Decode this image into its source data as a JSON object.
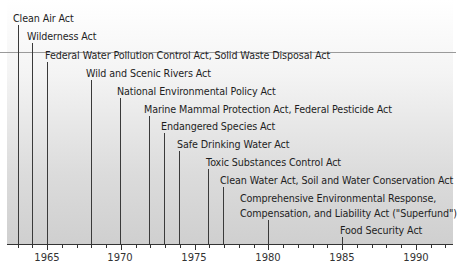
{
  "chart_data": {
    "type": "timeline",
    "title": "",
    "xlabel": "",
    "ylabel": "",
    "xlim": [
      1962,
      1992
    ],
    "tick_labels": [
      "1965",
      "1970",
      "1975",
      "1980",
      "1985",
      "1990"
    ],
    "events": [
      {
        "year": 1963,
        "label": "Clean Air Act"
      },
      {
        "year": 1964,
        "label": "Wilderness Act"
      },
      {
        "year": 1965,
        "label": "Federal Water Pollution Control Act, Solid Waste Disposal Act"
      },
      {
        "year": 1968,
        "label": "Wild and Scenic Rivers Act"
      },
      {
        "year": 1970,
        "label": "National Environmental Policy Act"
      },
      {
        "year": 1972,
        "label": "Marine Mammal Protection Act, Federal Pesticide Act"
      },
      {
        "year": 1973,
        "label": "Endangered Species Act"
      },
      {
        "year": 1974,
        "label": "Safe Drinking Water Act"
      },
      {
        "year": 1976,
        "label": "Toxic Substances Control Act"
      },
      {
        "year": 1977,
        "label": "Clean Water Act, Soil and Water Conservation Act"
      },
      {
        "year": 1980,
        "label": "Comprehensive Environmental Response, Compensation, and Liability Act (\"Superfund\")",
        "label_line1": "Comprehensive Environmental Response,",
        "label_line2": "Compensation, and Liability Act (\"Superfund\")"
      },
      {
        "year": 1985,
        "label": "Food Security Act"
      }
    ]
  }
}
